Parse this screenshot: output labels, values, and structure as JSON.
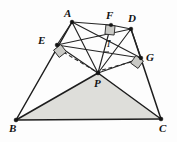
{
  "figure": {
    "background_color": "#fdfdfd",
    "line_color": "#1d1d1d",
    "shaded_region_color": "#dededa",
    "angle_marker_color": "#c9c9c5",
    "labels": [
      {
        "id": "A",
        "text": "A",
        "x": 64,
        "y": 8,
        "style": "normal"
      },
      {
        "id": "F",
        "text": "F",
        "x": 106,
        "y": 10,
        "style": "normal"
      },
      {
        "id": "D",
        "text": "D",
        "x": 128,
        "y": 13,
        "style": "normal"
      },
      {
        "id": "E",
        "text": "E",
        "x": 38,
        "y": 35,
        "style": "normal"
      },
      {
        "id": "I",
        "text": "I",
        "x": 107,
        "y": 40,
        "style": "small"
      },
      {
        "id": "G",
        "text": "G",
        "x": 146,
        "y": 52,
        "style": "normal"
      },
      {
        "id": "P",
        "text": "P",
        "x": 94,
        "y": 78,
        "style": "normal"
      },
      {
        "id": "B",
        "text": "B",
        "x": 9,
        "y": 123,
        "style": "normal"
      },
      {
        "id": "C",
        "text": "C",
        "x": 159,
        "y": 123,
        "style": "normal"
      }
    ],
    "points": [
      {
        "id": "A",
        "x": 72,
        "y": 22
      },
      {
        "id": "F",
        "x": 111,
        "y": 25
      },
      {
        "id": "D",
        "x": 131,
        "y": 29
      },
      {
        "id": "E",
        "x": 57,
        "y": 45
      },
      {
        "id": "G",
        "x": 141,
        "y": 58
      },
      {
        "id": "P",
        "x": 98,
        "y": 73
      },
      {
        "id": "B",
        "x": 16,
        "y": 120
      },
      {
        "id": "C",
        "x": 161,
        "y": 119
      }
    ],
    "segments": [
      {
        "id": "A-F",
        "from": "A",
        "to": "F",
        "kind": "solid"
      },
      {
        "id": "F-D",
        "from": "F",
        "to": "D",
        "kind": "solid"
      },
      {
        "id": "A-E",
        "from": "A",
        "to": "E",
        "kind": "solid"
      },
      {
        "id": "A-B",
        "from": "A",
        "to": "B",
        "kind": "solid"
      },
      {
        "id": "D-G",
        "from": "D",
        "to": "G",
        "kind": "solid"
      },
      {
        "id": "D-C",
        "from": "D",
        "to": "C",
        "kind": "solid"
      },
      {
        "id": "E-D",
        "from": "E",
        "to": "D",
        "kind": "solid"
      },
      {
        "id": "E-G",
        "from": "E",
        "to": "G",
        "kind": "solid"
      },
      {
        "id": "A-G",
        "from": "A",
        "to": "G",
        "kind": "solid"
      },
      {
        "id": "A-P",
        "from": "A",
        "to": "P",
        "kind": "solid"
      },
      {
        "id": "E-P",
        "from": "E",
        "to": "P",
        "kind": "solid"
      },
      {
        "id": "F-P",
        "from": "F",
        "to": "P",
        "kind": "solid"
      },
      {
        "id": "D-P",
        "from": "D",
        "to": "P",
        "kind": "solid"
      },
      {
        "id": "G-P",
        "from": "G",
        "to": "P",
        "kind": "solid"
      },
      {
        "id": "B-P",
        "from": "B",
        "to": "P",
        "kind": "solid"
      },
      {
        "id": "P-C",
        "from": "P",
        "to": "C",
        "kind": "solid"
      },
      {
        "id": "B-C",
        "from": "B",
        "to": "C",
        "kind": "solid"
      }
    ],
    "dashed_segments": [
      {
        "id": "P-E-dashed",
        "from": "P",
        "to": "E"
      },
      {
        "id": "P-G-dashed",
        "from": "P",
        "to": "G"
      }
    ],
    "shaded_region": {
      "id": "triangle-BPC",
      "vertices": [
        "B",
        "P",
        "C"
      ]
    },
    "right_angle_markers": [
      {
        "id": "right-angle-at-E",
        "at": "E",
        "rotation": -38
      },
      {
        "id": "right-angle-at-F",
        "at": "F",
        "rotation": 6
      },
      {
        "id": "right-angle-at-G",
        "at": "G",
        "rotation": 36
      }
    ]
  }
}
